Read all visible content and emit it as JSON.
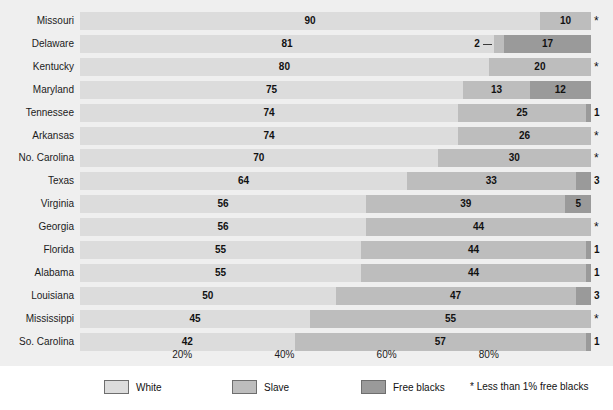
{
  "chart_data": {
    "type": "bar",
    "subtype": "stacked-horizontal-100pct",
    "title": "",
    "xlabel": "",
    "ylabel": "",
    "xlim": [
      0,
      100
    ],
    "grid": false,
    "legend_position": "bottom",
    "categories": [
      "Missouri",
      "Delaware",
      "Kentucky",
      "Maryland",
      "Tennessee",
      "Arkansas",
      "No. Carolina",
      "Texas",
      "Virginia",
      "Georgia",
      "Florida",
      "Alabama",
      "Louisiana",
      "Mississippi",
      "So. Carolina"
    ],
    "series": [
      {
        "name": "White",
        "values": [
          90,
          81,
          80,
          75,
          74,
          74,
          70,
          64,
          56,
          56,
          55,
          55,
          50,
          45,
          42
        ]
      },
      {
        "name": "Slave",
        "values": [
          10,
          2,
          20,
          13,
          25,
          26,
          30,
          33,
          39,
          44,
          44,
          44,
          47,
          55,
          57
        ]
      },
      {
        "name": "Free blacks",
        "values": [
          0,
          17,
          0,
          12,
          1,
          0,
          0,
          3,
          5,
          0,
          1,
          1,
          3,
          0,
          1
        ]
      }
    ],
    "rows": [
      {
        "state": "Missouri",
        "white": 90,
        "slave": 10,
        "free": 0,
        "white_label": "90",
        "slave_label": "10",
        "free_label": "*",
        "leader": false
      },
      {
        "state": "Delaware",
        "white": 81,
        "slave": 2,
        "free": 17,
        "white_label": "81",
        "slave_label": "2",
        "free_label": "17",
        "leader": true
      },
      {
        "state": "Kentucky",
        "white": 80,
        "slave": 20,
        "free": 0,
        "white_label": "80",
        "slave_label": "20",
        "free_label": "*",
        "leader": false
      },
      {
        "state": "Maryland",
        "white": 75,
        "slave": 13,
        "free": 12,
        "white_label": "75",
        "slave_label": "13",
        "free_label": "12",
        "leader": false
      },
      {
        "state": "Tennessee",
        "white": 74,
        "slave": 25,
        "free": 1,
        "white_label": "74",
        "slave_label": "25",
        "free_label": "1",
        "leader": false
      },
      {
        "state": "Arkansas",
        "white": 74,
        "slave": 26,
        "free": 0,
        "white_label": "74",
        "slave_label": "26",
        "free_label": "*",
        "leader": false
      },
      {
        "state": "No. Carolina",
        "white": 70,
        "slave": 30,
        "free": 0,
        "white_label": "70",
        "slave_label": "30",
        "free_label": "*",
        "leader": false
      },
      {
        "state": "Texas",
        "white": 64,
        "slave": 33,
        "free": 3,
        "white_label": "64",
        "slave_label": "33",
        "free_label": "3",
        "leader": false
      },
      {
        "state": "Virginia",
        "white": 56,
        "slave": 39,
        "free": 5,
        "white_label": "56",
        "slave_label": "39",
        "free_label": "5",
        "leader": false
      },
      {
        "state": "Georgia",
        "white": 56,
        "slave": 44,
        "free": 0,
        "white_label": "56",
        "slave_label": "44",
        "free_label": "*",
        "leader": false
      },
      {
        "state": "Florida",
        "white": 55,
        "slave": 44,
        "free": 1,
        "white_label": "55",
        "slave_label": "44",
        "free_label": "1",
        "leader": false
      },
      {
        "state": "Alabama",
        "white": 55,
        "slave": 44,
        "free": 1,
        "white_label": "55",
        "slave_label": "44",
        "free_label": "1",
        "leader": false
      },
      {
        "state": "Louisiana",
        "white": 50,
        "slave": 47,
        "free": 3,
        "white_label": "50",
        "slave_label": "47",
        "free_label": "3",
        "leader": false
      },
      {
        "state": "Mississippi",
        "white": 45,
        "slave": 55,
        "free": 0,
        "white_label": "45",
        "slave_label": "55",
        "free_label": "*",
        "leader": false
      },
      {
        "state": "So. Carolina",
        "white": 42,
        "slave": 57,
        "free": 1,
        "white_label": "42",
        "slave_label": "57",
        "free_label": "1",
        "leader": false
      }
    ],
    "xticks": [
      {
        "value": 20,
        "label": "20%"
      },
      {
        "value": 40,
        "label": "40%"
      },
      {
        "value": 60,
        "label": "60%"
      },
      {
        "value": 80,
        "label": "80%"
      }
    ],
    "legend": [
      {
        "label": "White",
        "color": "#dcdcdc"
      },
      {
        "label": "Slave",
        "color": "#bdbdbd"
      },
      {
        "label": "Free blacks",
        "color": "#9a9a9a"
      }
    ],
    "footnote": "* Less than 1% free blacks",
    "colors": {
      "white": "#dcdcdc",
      "slave": "#bdbdbd",
      "free": "#9a9a9a",
      "plot_background": "#efefef",
      "legend_background": "#ffffff",
      "text": "#111111"
    }
  }
}
